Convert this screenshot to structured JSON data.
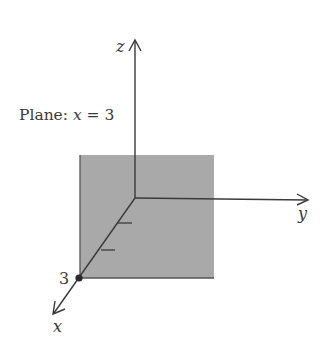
{
  "diagram": {
    "title_prefix": "Plane: ",
    "title_var": "x",
    "title_suffix": " = 3",
    "axes": {
      "x_label": "x",
      "y_label": "y",
      "z_label": "z"
    },
    "point_label": "3",
    "colors": {
      "plane_fill": "#a9a9a9",
      "axis_stroke": "#3a3a3a",
      "background": "#ffffff"
    }
  }
}
